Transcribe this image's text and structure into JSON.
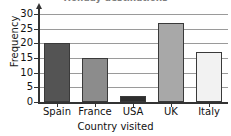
{
  "chart_data": {
    "type": "bar",
    "title": "Holiday destinations",
    "title_clipped": true,
    "categories": [
      "Spain",
      "France",
      "USA",
      "UK",
      "Italy"
    ],
    "values": [
      20,
      15,
      2,
      27,
      17
    ],
    "xlabel": "Country visited",
    "ylabel": "Frequency",
    "ylim": [
      0,
      30
    ],
    "ytick_labels": [
      "0",
      "5",
      "10",
      "15",
      "20",
      "25",
      "30"
    ],
    "ytick_values": [
      0,
      5,
      10,
      15,
      20,
      25,
      30
    ],
    "grid": "horizontal",
    "legend": "none",
    "bar_colors": [
      "#545454",
      "#8c8c8c",
      "#2e2e2e",
      "#a8a8a8",
      "#f2f2f2"
    ],
    "bar_edge_color": "#3a3a3a",
    "grid_color": "#9a9a9a",
    "axis_color": "#333333"
  }
}
